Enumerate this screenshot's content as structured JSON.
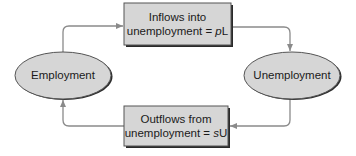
{
  "diagram": {
    "type": "flow",
    "nodes": {
      "employment": {
        "label": "Employment",
        "shape": "ellipse"
      },
      "unemployment": {
        "label": "Unemployment",
        "shape": "ellipse"
      },
      "inflows": {
        "line1": "Inflows into",
        "line2_prefix": "unemployment = ",
        "line2_var": "p",
        "line2_suffix": "L",
        "shape": "box"
      },
      "outflows": {
        "line1": "Outflows from",
        "line2_prefix": "unemployment = ",
        "line2_var": "s",
        "line2_suffix": "U",
        "shape": "box"
      }
    },
    "edges": [
      {
        "from": "Employment",
        "to": "Inflows into unemployment = pL"
      },
      {
        "from": "Inflows into unemployment = pL",
        "to": "Unemployment"
      },
      {
        "from": "Unemployment",
        "to": "Outflows from unemployment = sU"
      },
      {
        "from": "Outflows from unemployment = sU",
        "to": "Employment"
      }
    ],
    "colors": {
      "fill": "#d6d6d6",
      "stroke": "#3a3a3a",
      "shadow": "#2a2a2a",
      "connector": "#8a8a8a",
      "text": "#1a1a1a"
    }
  }
}
